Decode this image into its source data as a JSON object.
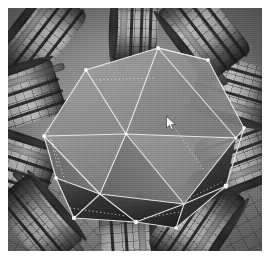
{
  "app": {
    "title": "3D Viewport Render",
    "render_style": "shaded-wireframe",
    "color_mode": "grayscale"
  },
  "viewport": {
    "name": "perspective-viewport",
    "frame": {
      "x": 8,
      "y": 8,
      "width": 254,
      "height": 243
    },
    "background_color": "#8b8b8b",
    "vignette": true
  },
  "scene": {
    "description": "Grayscale 3D render: a selected faceted polyhedron at center surrounded by radiating segmented cylindrical tubes",
    "selected_object": {
      "name": "polyhedron",
      "label": "Icosahedral Hull",
      "selection_color": "#f2f2f2",
      "vertex_dot_color": "#ffffff",
      "wireframe": true,
      "vertex_count": 12,
      "face_count": 14,
      "surface_color": "#8e8e8e",
      "shadow_face_color": "#3a3a3a"
    },
    "tubes": [
      {
        "name": "tube-top-center",
        "x": 104,
        "y": -16,
        "w": 46,
        "h": 72,
        "rot": 2,
        "segments": 5
      },
      {
        "name": "tube-top-left",
        "x": 6,
        "y": -18,
        "w": 52,
        "h": 94,
        "rot": 38,
        "segments": 5
      },
      {
        "name": "tube-upper-left",
        "x": -22,
        "y": 44,
        "w": 58,
        "h": 92,
        "rot": 72,
        "segments": 5
      },
      {
        "name": "tube-left",
        "x": -26,
        "y": 110,
        "w": 56,
        "h": 88,
        "rot": 108,
        "segments": 5
      },
      {
        "name": "tube-lower-left",
        "x": 4,
        "y": 170,
        "w": 52,
        "h": 86,
        "rot": 140,
        "segments": 4
      },
      {
        "name": "tube-bottom",
        "x": 92,
        "y": 196,
        "w": 56,
        "h": 74,
        "rot": 176,
        "segments": 4
      },
      {
        "name": "tube-lower-right",
        "x": 158,
        "y": 168,
        "w": 62,
        "h": 92,
        "rot": 214,
        "segments": 5
      },
      {
        "name": "tube-right",
        "x": 206,
        "y": 104,
        "w": 60,
        "h": 88,
        "rot": 250,
        "segments": 5
      },
      {
        "name": "tube-upper-right",
        "x": 200,
        "y": 40,
        "w": 60,
        "h": 86,
        "rot": 286,
        "segments": 5
      },
      {
        "name": "tube-top-right",
        "x": 168,
        "y": -20,
        "w": 56,
        "h": 88,
        "rot": 322,
        "segments": 5
      }
    ]
  },
  "cursor": {
    "name": "mouse-pointer",
    "x": 158,
    "y": 108,
    "color": "#ffffff"
  }
}
